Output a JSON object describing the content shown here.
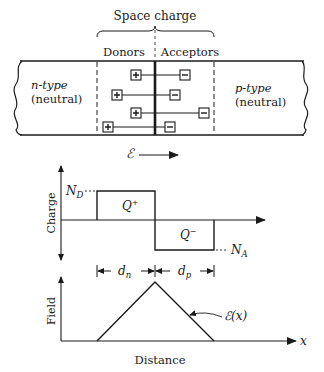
{
  "figure": {
    "header": {
      "space_charge_label": "Space charge",
      "donors_label": "Donors",
      "acceptors_label": "Acceptors"
    },
    "junction_bar": {
      "n_region_label_line1": "n-type",
      "n_region_label_line2": "(neutral)",
      "p_region_label_line1": "p-type",
      "p_region_label_line2": "(neutral)",
      "donor_symbol": "+",
      "acceptor_symbol": "−",
      "ion_pairs": 4
    },
    "field_arrow": {
      "symbol": "ℰ",
      "direction": "right"
    },
    "charge_plot": {
      "ylabel": "Charge",
      "nd_label": "N",
      "nd_sub": "D",
      "na_label": "N",
      "na_sub": "A",
      "q_plus": "Q",
      "q_plus_sup": "+",
      "q_minus": "Q",
      "q_minus_sup": "−"
    },
    "dimensions": {
      "dn_label": "d",
      "dn_sub": "n",
      "dp_label": "d",
      "dp_sub": "p"
    },
    "field_plot": {
      "ylabel": "Field",
      "xlabel": "Distance",
      "x_axis_symbol": "x",
      "curve_label": "ℰ(x)"
    },
    "colors": {
      "ink": "#1a1a1a",
      "background": "#ffffff"
    }
  }
}
